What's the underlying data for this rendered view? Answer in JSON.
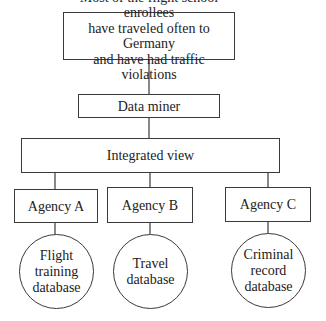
{
  "diagram": {
    "type": "hierarchy",
    "nodes": {
      "conclusion": {
        "label": "Most of the flight school enrollees\nhave traveled often to Germany\nand have had traffic violations",
        "shape": "rectangle"
      },
      "data_miner": {
        "label": "Data miner",
        "shape": "rectangle"
      },
      "integrated_view": {
        "label": "Integrated view",
        "shape": "rectangle"
      },
      "agencies": [
        {
          "label": "Agency A",
          "shape": "rectangle"
        },
        {
          "label": "Agency B",
          "shape": "rectangle"
        },
        {
          "label": "Agency C",
          "shape": "rectangle"
        }
      ],
      "databases": [
        {
          "label": "Flight\ntraining\ndatabase",
          "shape": "circle"
        },
        {
          "label": "Travel\ndatabase",
          "shape": "circle"
        },
        {
          "label": "Criminal\nrecord\ndatabase",
          "shape": "circle"
        }
      ]
    },
    "edges": [
      [
        "conclusion",
        "data_miner"
      ],
      [
        "data_miner",
        "integrated_view"
      ],
      [
        "integrated_view",
        "Agency A"
      ],
      [
        "integrated_view",
        "Agency B"
      ],
      [
        "integrated_view",
        "Agency C"
      ],
      [
        "Agency A",
        "Flight training database"
      ],
      [
        "Agency B",
        "Travel database"
      ],
      [
        "Agency C",
        "Criminal record database"
      ]
    ]
  },
  "colors": {
    "line": "#3a3a3a",
    "background": "#ffffff",
    "text": "#222222"
  }
}
